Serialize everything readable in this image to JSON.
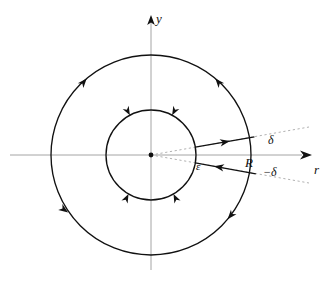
{
  "figure": {
    "kind": "keyhole-contour-diagram",
    "background_color": "#ffffff",
    "curve_color": "#111111",
    "axis_color": "#999999",
    "dotted_color": "#a8a8a8",
    "width": 334,
    "height": 282
  },
  "axes": {
    "origin": {
      "x": 151,
      "y": 155
    },
    "vertical": {
      "label": "y",
      "arrow": "up",
      "top_y": 18,
      "bottom_y": 270
    },
    "horizontal": {
      "label": "r",
      "arrow": "right",
      "left_x": 10,
      "right_x": 310
    }
  },
  "circles": [
    {
      "name": "outer-circle",
      "label": "R",
      "radius": 100,
      "direction": "counterclockwise",
      "arrow_angles_deg": [
        50,
        130,
        215,
        320
      ]
    },
    {
      "name": "inner-circle",
      "label": "ε",
      "radius": 45,
      "direction": "clockwise",
      "arrow_angles_deg": [
        62,
        118,
        240,
        300
      ]
    }
  ],
  "rays": [
    {
      "name": "outgoing-ray",
      "angle_deg": 10,
      "direction": "outward",
      "from_radius": 45,
      "to_radius": 105,
      "arrow_at_radius": 78
    },
    {
      "name": "incoming-ray",
      "angle_deg": -10,
      "direction": "inward",
      "from_radius": 105,
      "to_radius": 45,
      "arrow_at_radius": 80
    }
  ],
  "guide_lines": [
    {
      "name": "upper-delta-guide",
      "angle_deg": 10,
      "style": "dotted",
      "label": "δ",
      "to_radius": 160
    },
    {
      "name": "lower-delta-guide",
      "angle_deg": -10,
      "style": "dotted",
      "label": "−δ",
      "to_radius": 160
    }
  ],
  "labels": {
    "y_axis": "y",
    "r_axis": "r",
    "outer_radius": "R",
    "inner_radius": "ε",
    "upper_angle": "δ",
    "lower_angle": "−δ"
  }
}
